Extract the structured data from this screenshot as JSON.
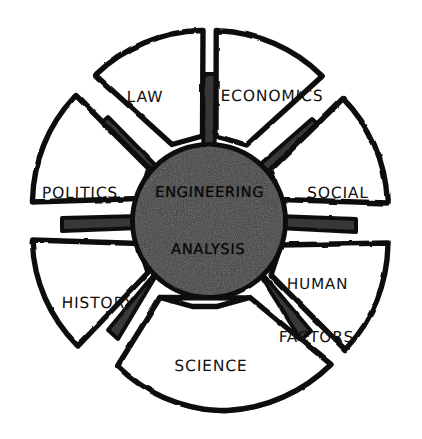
{
  "figure": {
    "kind": "radial-hub-and-spoke-diagram",
    "style": "hand-drawn-ink-sketch",
    "background_color": "#ffffff",
    "ink_color": "#111111",
    "hub_fill_color": "#383838",
    "petal_fill_color": "#ffffff",
    "spoke_fill_color": "#383838"
  },
  "center": {
    "name": "engineering-analysis-hub",
    "line1": "ENGINEERING",
    "line2": "ANALYSIS",
    "fill": "#383838",
    "text_color": "#0a0a0a"
  },
  "petals": [
    {
      "id": "law",
      "label": "LAW",
      "lines": [
        "LAW"
      ],
      "position": "top-left",
      "label_x": 145,
      "label_y": 97,
      "angle_center_deg": -112.5
    },
    {
      "id": "economics",
      "label": "ECONOMICS",
      "lines": [
        "ECONOMICS"
      ],
      "position": "top-right",
      "label_x": 272,
      "label_y": 96,
      "angle_center_deg": -67.5
    },
    {
      "id": "social",
      "label": "SOCIAL",
      "lines": [
        "SOCIAL"
      ],
      "position": "right",
      "label_x": 338,
      "label_y": 193,
      "angle_center_deg": -22.5
    },
    {
      "id": "human-factors",
      "label": "HUMAN FACTORS",
      "lines": [
        "HUMAN",
        "FACTORS"
      ],
      "position": "lower-right",
      "label_x": 317,
      "label_y": 311,
      "angle_center_deg": 22.5
    },
    {
      "id": "science",
      "label": "SCIENCE",
      "lines": [
        "SCIENCE"
      ],
      "position": "bottom",
      "label_x": 211,
      "label_y": 366,
      "angle_center_deg": 67.5
    },
    {
      "id": "history",
      "label": "HISTORY",
      "lines": [
        "HISTORY"
      ],
      "position": "lower-left",
      "label_x": 98,
      "label_y": 303,
      "angle_center_deg": 112.5
    },
    {
      "id": "politics",
      "label": "POLITICS",
      "lines": [
        "POLITICS"
      ],
      "position": "left",
      "label_x": 80,
      "label_y": 193,
      "angle_center_deg": 157.5
    },
    {
      "id": "unlabeled-top",
      "label": "",
      "lines": [],
      "position": "top",
      "label_x": 211,
      "label_y": 60,
      "angle_center_deg": -90
    }
  ],
  "geometry": {
    "center_x": 209,
    "center_y": 221,
    "hub_radius": 76,
    "petal_inner_radius": 86,
    "petal_outer_radius": 190,
    "petal_count": 8,
    "gap_degrees": 9,
    "spoke_count": 8,
    "spoke_outer_radius": 122,
    "stroke_width": 5
  }
}
